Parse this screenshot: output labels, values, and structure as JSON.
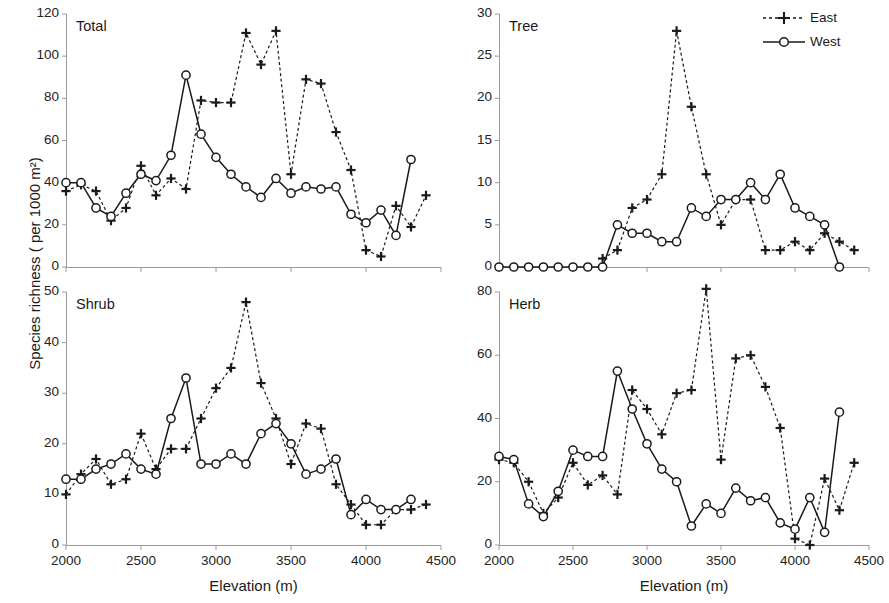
{
  "figure": {
    "ylabel": "Species richness ( per 1000 m²)",
    "xlabel_left": "Elevation (m)",
    "xlabel_right": "Elevation (m)"
  },
  "legend": {
    "east_label": "East",
    "west_label": "West",
    "east_color": "#1a1a1a",
    "west_color": "#1a1a1a"
  },
  "chart_data": [
    {
      "type": "line",
      "title": "Total",
      "xlabel": "Elevation (m)",
      "ylabel": "Species richness ( per 1000 m²)",
      "xlim": [
        2000,
        4500
      ],
      "ylim": [
        0,
        120
      ],
      "xticks": [
        2000,
        2500,
        3000,
        3500,
        4000,
        4500
      ],
      "yticks": [
        0,
        20,
        40,
        60,
        80,
        100,
        120
      ],
      "grid": false,
      "legend_position": "outside-top-right",
      "series": [
        {
          "name": "East",
          "x": [
            2000,
            2100,
            2200,
            2300,
            2400,
            2500,
            2600,
            2700,
            2800,
            2900,
            3000,
            3100,
            3200,
            3300,
            3400,
            3500,
            3600,
            3700,
            3800,
            3900,
            4000,
            4100,
            4200,
            4300,
            4400
          ],
          "values": [
            36,
            39,
            36,
            22,
            28,
            48,
            34,
            42,
            37,
            79,
            78,
            78,
            111,
            96,
            112,
            44,
            89,
            87,
            64,
            46,
            8,
            5,
            29,
            19,
            34
          ]
        },
        {
          "name": "West",
          "x": [
            2000,
            2100,
            2200,
            2300,
            2400,
            2500,
            2600,
            2700,
            2800,
            2900,
            3000,
            3100,
            3200,
            3300,
            3400,
            3500,
            3600,
            3700,
            3800,
            3900,
            4000,
            4100,
            4200,
            4300
          ],
          "values": [
            40,
            40,
            28,
            24,
            35,
            44,
            41,
            53,
            91,
            63,
            52,
            44,
            38,
            33,
            42,
            35,
            38,
            37,
            38,
            25,
            21,
            27,
            15,
            51
          ]
        }
      ]
    },
    {
      "type": "line",
      "title": "Tree",
      "xlabel": "Elevation (m)",
      "ylabel": "Species richness ( per 1000 m²)",
      "xlim": [
        2000,
        4500
      ],
      "ylim": [
        0,
        30
      ],
      "xticks": [
        2000,
        2500,
        3000,
        3500,
        4000,
        4500
      ],
      "yticks": [
        0,
        5,
        10,
        15,
        20,
        25,
        30
      ],
      "grid": false,
      "series": [
        {
          "name": "East",
          "x": [
            2700,
            2800,
            2900,
            3000,
            3100,
            3200,
            3300,
            3400,
            3500,
            3600,
            3700,
            3800,
            3900,
            4000,
            4100,
            4200,
            4300,
            4400
          ],
          "values": [
            1,
            2,
            7,
            8,
            11,
            28,
            19,
            11,
            5,
            8,
            8,
            2,
            2,
            3,
            2,
            4,
            3,
            2
          ]
        },
        {
          "name": "West",
          "x": [
            2000,
            2100,
            2200,
            2300,
            2400,
            2500,
            2600,
            2700,
            2800,
            2900,
            3000,
            3100,
            3200,
            3300,
            3400,
            3500,
            3600,
            3700,
            3800,
            3900,
            4000,
            4100,
            4200,
            4300
          ],
          "values": [
            0,
            0,
            0,
            0,
            0,
            0,
            0,
            0,
            5,
            4,
            4,
            3,
            3,
            7,
            6,
            8,
            8,
            10,
            8,
            11,
            7,
            6,
            5,
            0
          ]
        }
      ]
    },
    {
      "type": "line",
      "title": "Shrub",
      "xlabel": "Elevation (m)",
      "ylabel": "Species richness ( per 1000 m²)",
      "xlim": [
        2000,
        4500
      ],
      "ylim": [
        0,
        50
      ],
      "xticks": [
        2000,
        2500,
        3000,
        3500,
        4000,
        4500
      ],
      "yticks": [
        0,
        10,
        20,
        30,
        40,
        50
      ],
      "grid": false,
      "series": [
        {
          "name": "East",
          "x": [
            2000,
            2100,
            2200,
            2300,
            2400,
            2500,
            2600,
            2700,
            2800,
            2900,
            3000,
            3100,
            3200,
            3300,
            3400,
            3500,
            3600,
            3700,
            3800,
            3900,
            4000,
            4100,
            4200,
            4300,
            4400
          ],
          "values": [
            10,
            14,
            17,
            12,
            13,
            22,
            15,
            19,
            19,
            25,
            31,
            35,
            48,
            32,
            25,
            16,
            24,
            23,
            12,
            8,
            4,
            4,
            7,
            7,
            8
          ]
        },
        {
          "name": "West",
          "x": [
            2000,
            2100,
            2200,
            2300,
            2400,
            2500,
            2600,
            2700,
            2800,
            2900,
            3000,
            3100,
            3200,
            3300,
            3400,
            3500,
            3600,
            3700,
            3800,
            3900,
            4000,
            4100,
            4200,
            4300
          ],
          "values": [
            13,
            13,
            15,
            16,
            18,
            15,
            14,
            25,
            33,
            16,
            16,
            18,
            16,
            22,
            24,
            20,
            14,
            15,
            17,
            6,
            9,
            7,
            7,
            9
          ]
        }
      ]
    },
    {
      "type": "line",
      "title": "Herb",
      "xlabel": "Elevation (m)",
      "ylabel": "Species richness ( per 1000 m²)",
      "xlim": [
        2000,
        4500
      ],
      "ylim": [
        0,
        80
      ],
      "xticks": [
        2000,
        2500,
        3000,
        3500,
        4000,
        4500
      ],
      "yticks": [
        0,
        20,
        40,
        60,
        80
      ],
      "grid": false,
      "series": [
        {
          "name": "East",
          "x": [
            2000,
            2100,
            2200,
            2300,
            2400,
            2500,
            2600,
            2700,
            2800,
            2900,
            3000,
            3100,
            3200,
            3300,
            3400,
            3500,
            3600,
            3700,
            3800,
            3900,
            4000,
            4100,
            4200,
            4300,
            4400
          ],
          "values": [
            27,
            26,
            20,
            10,
            15,
            26,
            19,
            22,
            16,
            49,
            43,
            35,
            48,
            49,
            81,
            27,
            59,
            60,
            50,
            37,
            2,
            0,
            21,
            11,
            26
          ]
        },
        {
          "name": "West",
          "x": [
            2000,
            2100,
            2200,
            2300,
            2400,
            2500,
            2600,
            2700,
            2800,
            2900,
            3000,
            3100,
            3200,
            3300,
            3400,
            3500,
            3600,
            3700,
            3800,
            3900,
            4000,
            4100,
            4200,
            4300
          ],
          "values": [
            28,
            27,
            13,
            9,
            17,
            30,
            28,
            28,
            55,
            43,
            32,
            24,
            20,
            6,
            13,
            10,
            18,
            14,
            15,
            7,
            5,
            15,
            4,
            42
          ]
        }
      ]
    }
  ]
}
